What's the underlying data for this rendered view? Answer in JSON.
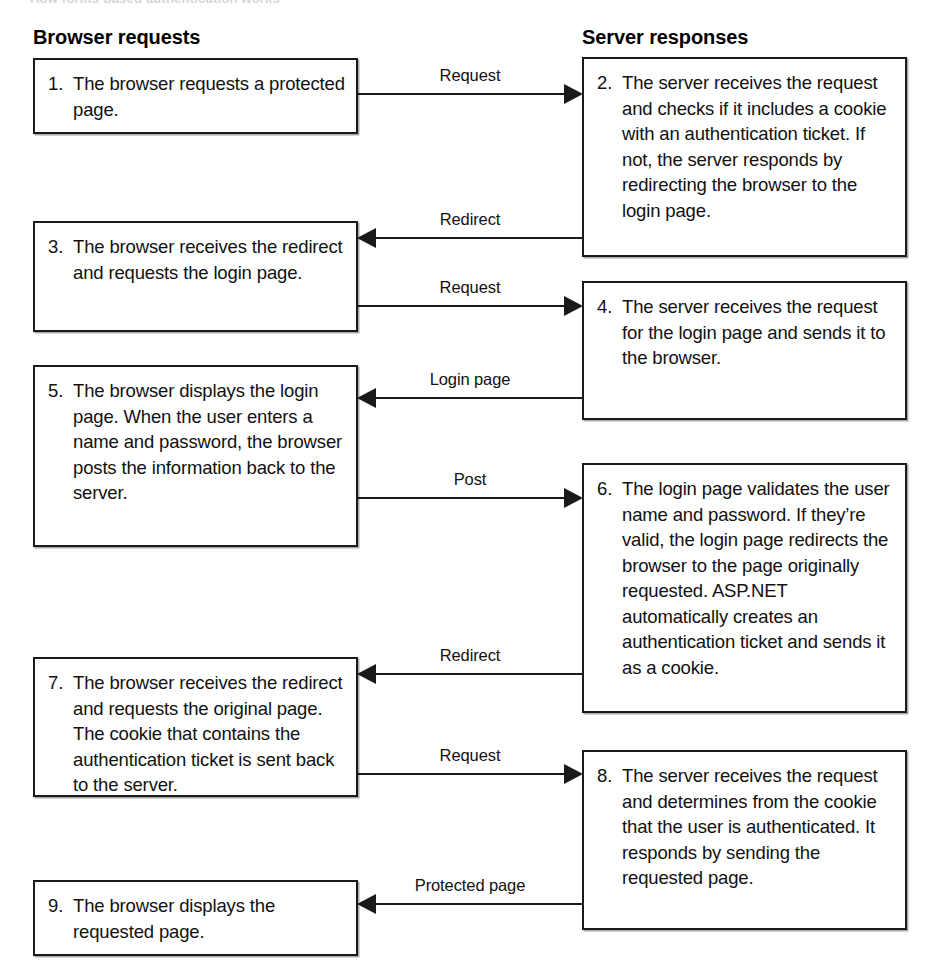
{
  "diagram": {
    "top_cropped_title": "How forms-based authentication works",
    "columns": [
      {
        "id": "browser",
        "header": "Browser requests"
      },
      {
        "id": "server",
        "header": "Server responses"
      }
    ],
    "steps": [
      {
        "num": "1.",
        "side": "browser",
        "text": "The browser requests a protected page."
      },
      {
        "num": "2.",
        "side": "server",
        "text": "The server receives the request and checks if it includes a cookie with an authentication ticket. If not, the server responds by redirecting the browser to the login page."
      },
      {
        "num": "3.",
        "side": "browser",
        "text": "The browser receives the redirect and requests the login page."
      },
      {
        "num": "4.",
        "side": "server",
        "text": "The server receives the request for the login page and sends it to the browser."
      },
      {
        "num": "5.",
        "side": "browser",
        "text": "The browser displays the login page. When the user enters a name and password, the browser posts the information back to the server."
      },
      {
        "num": "6.",
        "side": "server",
        "text": "The login page validates the user name and password. If they’re valid, the login page redirects the browser to the page originally requested. ASP.NET automatically creates an authentication ticket and sends it as a cookie."
      },
      {
        "num": "7.",
        "side": "browser",
        "text": "The browser receives the redirect and requests the original page. The cookie that contains the authentication ticket is sent back to the server."
      },
      {
        "num": "8.",
        "side": "server",
        "text": "The server receives the request and determines from the cookie that the user is authenticated. It responds by sending the requested page."
      },
      {
        "num": "9.",
        "side": "browser",
        "text": "The browser displays the requested page."
      }
    ],
    "arrows": [
      {
        "label": "Request",
        "direction": "right",
        "from_step": "1",
        "to_step": "2"
      },
      {
        "label": "Redirect",
        "direction": "left",
        "from_step": "2",
        "to_step": "3"
      },
      {
        "label": "Request",
        "direction": "right",
        "from_step": "3",
        "to_step": "4"
      },
      {
        "label": "Login page",
        "direction": "left",
        "from_step": "4",
        "to_step": "5"
      },
      {
        "label": "Post",
        "direction": "right",
        "from_step": "5",
        "to_step": "6"
      },
      {
        "label": "Redirect",
        "direction": "left",
        "from_step": "6",
        "to_step": "7"
      },
      {
        "label": "Request",
        "direction": "right",
        "from_step": "7",
        "to_step": "8"
      },
      {
        "label": "Protected page",
        "direction": "left",
        "from_step": "8",
        "to_step": "9"
      }
    ],
    "colors": {
      "stroke": "#1a1a1a",
      "text": "#111111",
      "background": "#ffffff"
    }
  }
}
